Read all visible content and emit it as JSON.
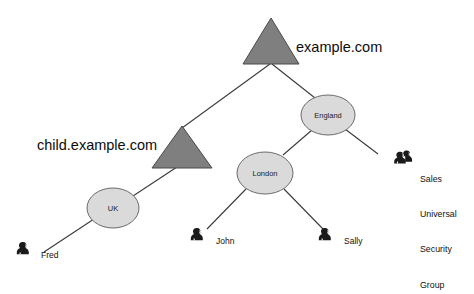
{
  "diagram": {
    "type": "tree",
    "title_visible": false,
    "background_color": "#ffffff",
    "palette": {
      "triangle_fill": "#7f7f7f",
      "triangle_stroke": "#4a4a4a",
      "circle_fill": "#dadada",
      "circle_stroke": "#6b6b6b",
      "edge_color": "#3a3a3a",
      "text_color": "#111111"
    },
    "domains": [
      {
        "id": "root-domain",
        "label": "example.com",
        "shape": "triangle",
        "label_position": "right"
      },
      {
        "id": "child-domain",
        "label": "child.example.com",
        "shape": "triangle",
        "label_position": "left"
      }
    ],
    "containers": [
      {
        "id": "england",
        "label": "England",
        "shape": "ellipse"
      },
      {
        "id": "london",
        "label": "London",
        "shape": "ellipse"
      },
      {
        "id": "uk",
        "label": "UK",
        "shape": "ellipse"
      }
    ],
    "users": [
      {
        "id": "fred",
        "label": "Fred",
        "icon": "user-icon"
      },
      {
        "id": "john",
        "label": "John",
        "icon": "user-icon"
      },
      {
        "id": "sally",
        "label": "Sally",
        "icon": "user-icon"
      }
    ],
    "groups": [
      {
        "id": "sales-group",
        "icon": "group-icon",
        "label_lines": [
          "Sales",
          "Universal",
          "Security",
          "Group"
        ],
        "label": "Sales Universal Security Group"
      }
    ],
    "edges": [
      {
        "from": "root-domain",
        "to": "child-domain"
      },
      {
        "from": "root-domain",
        "to": "england"
      },
      {
        "from": "england",
        "to": "london"
      },
      {
        "from": "england",
        "to": "sales-group"
      },
      {
        "from": "london",
        "to": "john"
      },
      {
        "from": "london",
        "to": "sally"
      },
      {
        "from": "child-domain",
        "to": "uk"
      },
      {
        "from": "uk",
        "to": "fred"
      }
    ]
  }
}
